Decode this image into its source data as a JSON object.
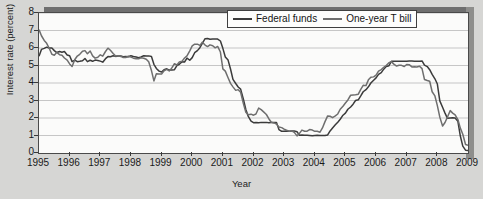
{
  "chart_data": {
    "type": "line",
    "title": "",
    "xlabel": "Year",
    "ylabel": "Interest rate (percent)",
    "xlim": [
      1995,
      2009
    ],
    "ylim": [
      0,
      8
    ],
    "xticks": [
      "1995",
      "1996",
      "1997",
      "1998",
      "1999",
      "2000",
      "2001",
      "2002",
      "2003",
      "2004",
      "2005",
      "2006",
      "2007",
      "2008",
      "2009"
    ],
    "yticks": [
      "0",
      "1",
      "2",
      "3",
      "4",
      "5",
      "6",
      "7",
      "8"
    ],
    "grid": "horizontal",
    "legend_position": "top-right",
    "series": [
      {
        "name": "Federal funds",
        "color": "#3b3b3b",
        "x": [
          1995.0,
          1995.08,
          1995.17,
          1995.25,
          1995.33,
          1995.42,
          1995.5,
          1995.58,
          1995.67,
          1995.75,
          1995.83,
          1995.92,
          1996.0,
          1996.08,
          1996.17,
          1996.25,
          1996.33,
          1996.42,
          1996.5,
          1996.58,
          1996.67,
          1996.75,
          1996.83,
          1996.92,
          1997.0,
          1997.08,
          1997.17,
          1997.25,
          1997.33,
          1997.42,
          1997.5,
          1997.58,
          1997.67,
          1997.75,
          1997.83,
          1997.92,
          1998.0,
          1998.08,
          1998.17,
          1998.25,
          1998.33,
          1998.42,
          1998.5,
          1998.58,
          1998.67,
          1998.75,
          1998.83,
          1998.92,
          1999.0,
          1999.08,
          1999.17,
          1999.25,
          1999.33,
          1999.42,
          1999.5,
          1999.58,
          1999.67,
          1999.75,
          1999.83,
          1999.92,
          2000.0,
          2000.08,
          2000.17,
          2000.25,
          2000.33,
          2000.42,
          2000.5,
          2000.58,
          2000.67,
          2000.75,
          2000.83,
          2000.92,
          2001.0,
          2001.08,
          2001.17,
          2001.25,
          2001.33,
          2001.42,
          2001.5,
          2001.58,
          2001.67,
          2001.75,
          2001.83,
          2001.92,
          2002.0,
          2002.08,
          2002.17,
          2002.25,
          2002.33,
          2002.42,
          2002.5,
          2002.58,
          2002.67,
          2002.75,
          2002.83,
          2002.92,
          2003.0,
          2003.08,
          2003.17,
          2003.25,
          2003.33,
          2003.42,
          2003.5,
          2003.58,
          2003.67,
          2003.75,
          2003.83,
          2003.92,
          2004.0,
          2004.08,
          2004.17,
          2004.25,
          2004.33,
          2004.42,
          2004.5,
          2004.58,
          2004.67,
          2004.75,
          2004.83,
          2004.92,
          2005.0,
          2005.08,
          2005.17,
          2005.25,
          2005.33,
          2005.42,
          2005.5,
          2005.58,
          2005.67,
          2005.75,
          2005.83,
          2005.92,
          2006.0,
          2006.08,
          2006.17,
          2006.25,
          2006.33,
          2006.42,
          2006.5,
          2006.58,
          2006.67,
          2006.75,
          2006.83,
          2006.92,
          2007.0,
          2007.08,
          2007.17,
          2007.25,
          2007.33,
          2007.42,
          2007.5,
          2007.58,
          2007.67,
          2007.75,
          2007.83,
          2007.92,
          2008.0,
          2008.08,
          2008.17,
          2008.25,
          2008.33,
          2008.42,
          2008.5,
          2008.58,
          2008.67,
          2008.75,
          2008.83,
          2008.92,
          2009.0
        ],
        "values": [
          5.53,
          5.92,
          5.98,
          6.05,
          6.0,
          6.0,
          5.85,
          5.74,
          5.8,
          5.76,
          5.8,
          5.6,
          5.56,
          5.22,
          5.31,
          5.22,
          5.24,
          5.27,
          5.4,
          5.22,
          5.3,
          5.24,
          5.31,
          5.29,
          5.25,
          5.19,
          5.39,
          5.51,
          5.5,
          5.56,
          5.52,
          5.54,
          5.54,
          5.5,
          5.52,
          5.5,
          5.56,
          5.51,
          5.49,
          5.45,
          5.49,
          5.56,
          5.54,
          5.55,
          5.51,
          5.07,
          4.83,
          4.68,
          4.63,
          4.76,
          4.81,
          4.74,
          4.74,
          4.76,
          4.99,
          5.07,
          5.22,
          5.2,
          5.42,
          5.3,
          5.45,
          5.73,
          5.85,
          6.02,
          6.27,
          6.53,
          6.54,
          6.5,
          6.52,
          6.51,
          6.51,
          6.4,
          5.98,
          5.49,
          5.31,
          4.8,
          4.21,
          3.97,
          3.77,
          3.65,
          3.07,
          2.49,
          2.09,
          1.82,
          1.73,
          1.74,
          1.73,
          1.75,
          1.75,
          1.75,
          1.73,
          1.74,
          1.75,
          1.75,
          1.34,
          1.24,
          1.24,
          1.26,
          1.25,
          1.26,
          1.26,
          1.22,
          1.01,
          1.03,
          1.01,
          1.01,
          1.0,
          0.98,
          1.0,
          1.01,
          1.0,
          1.0,
          1.0,
          1.03,
          1.26,
          1.43,
          1.61,
          1.76,
          1.93,
          2.16,
          2.28,
          2.5,
          2.63,
          2.79,
          3.0,
          3.04,
          3.26,
          3.5,
          3.62,
          3.78,
          4.0,
          4.16,
          4.29,
          4.49,
          4.59,
          4.79,
          4.94,
          4.99,
          5.24,
          5.25,
          5.25,
          5.25,
          5.25,
          5.24,
          5.25,
          5.26,
          5.26,
          5.25,
          5.25,
          5.25,
          5.26,
          5.02,
          4.94,
          4.76,
          4.49,
          4.24,
          3.94,
          2.98,
          2.61,
          2.28,
          1.98,
          2.0,
          2.01,
          2.0,
          1.81,
          0.97,
          0.39,
          0.16,
          0.15
        ]
      },
      {
        "name": "One-year T bill",
        "color": "#6e6e6e",
        "x": [
          1995.0,
          1995.08,
          1995.17,
          1995.25,
          1995.33,
          1995.42,
          1995.5,
          1995.58,
          1995.67,
          1995.75,
          1995.83,
          1995.92,
          1996.0,
          1996.08,
          1996.17,
          1996.25,
          1996.33,
          1996.42,
          1996.5,
          1996.58,
          1996.67,
          1996.75,
          1996.83,
          1996.92,
          1997.0,
          1997.08,
          1997.17,
          1997.25,
          1997.33,
          1997.42,
          1997.5,
          1997.58,
          1997.67,
          1997.75,
          1997.83,
          1997.92,
          1998.0,
          1998.08,
          1998.17,
          1998.25,
          1998.33,
          1998.42,
          1998.5,
          1998.58,
          1998.67,
          1998.75,
          1998.83,
          1998.92,
          1999.0,
          1999.08,
          1999.17,
          1999.25,
          1999.33,
          1999.42,
          1999.5,
          1999.58,
          1999.67,
          1999.75,
          1999.83,
          1999.92,
          2000.0,
          2000.08,
          2000.17,
          2000.25,
          2000.33,
          2000.42,
          2000.5,
          2000.58,
          2000.67,
          2000.75,
          2000.83,
          2000.92,
          2001.0,
          2001.08,
          2001.17,
          2001.25,
          2001.33,
          2001.42,
          2001.5,
          2001.58,
          2001.67,
          2001.75,
          2001.83,
          2001.92,
          2002.0,
          2002.08,
          2002.17,
          2002.25,
          2002.33,
          2002.42,
          2002.5,
          2002.58,
          2002.67,
          2002.75,
          2002.83,
          2002.92,
          2003.0,
          2003.08,
          2003.17,
          2003.25,
          2003.33,
          2003.42,
          2003.5,
          2003.58,
          2003.67,
          2003.75,
          2003.83,
          2003.92,
          2004.0,
          2004.08,
          2004.17,
          2004.25,
          2004.33,
          2004.42,
          2004.5,
          2004.58,
          2004.67,
          2004.75,
          2004.83,
          2004.92,
          2005.0,
          2005.08,
          2005.17,
          2005.25,
          2005.33,
          2005.42,
          2005.5,
          2005.58,
          2005.67,
          2005.75,
          2005.83,
          2005.92,
          2006.0,
          2006.08,
          2006.17,
          2006.25,
          2006.33,
          2006.42,
          2006.5,
          2006.58,
          2006.67,
          2006.75,
          2006.83,
          2006.92,
          2007.0,
          2007.08,
          2007.17,
          2007.25,
          2007.33,
          2007.42,
          2007.5,
          2007.58,
          2007.67,
          2007.75,
          2007.83,
          2007.92,
          2008.0,
          2008.08,
          2008.17,
          2008.25,
          2008.33,
          2008.42,
          2008.5,
          2008.58,
          2008.67,
          2008.75,
          2008.83,
          2008.92,
          2009.0
        ],
        "values": [
          7.05,
          6.7,
          6.43,
          6.27,
          6.0,
          5.64,
          5.59,
          5.75,
          5.62,
          5.59,
          5.43,
          5.31,
          5.09,
          4.94,
          5.34,
          5.54,
          5.64,
          5.81,
          5.85,
          5.67,
          5.83,
          5.55,
          5.42,
          5.47,
          5.61,
          5.53,
          5.8,
          5.99,
          5.87,
          5.69,
          5.54,
          5.56,
          5.52,
          5.46,
          5.46,
          5.53,
          5.48,
          5.42,
          5.39,
          5.38,
          5.44,
          5.41,
          5.36,
          5.21,
          4.71,
          4.12,
          4.53,
          4.52,
          4.51,
          4.7,
          4.78,
          4.69,
          4.85,
          5.1,
          5.03,
          5.2,
          5.25,
          5.43,
          5.55,
          5.84,
          6.12,
          6.22,
          6.22,
          6.15,
          6.33,
          6.17,
          6.08,
          6.18,
          6.13,
          6.01,
          6.09,
          5.77,
          4.81,
          4.68,
          4.3,
          3.98,
          3.78,
          3.58,
          3.62,
          3.47,
          2.82,
          2.33,
          2.18,
          2.22,
          2.16,
          2.23,
          2.57,
          2.48,
          2.35,
          2.2,
          1.96,
          1.76,
          1.72,
          1.65,
          1.49,
          1.45,
          1.36,
          1.3,
          1.24,
          1.27,
          1.18,
          0.98,
          1.12,
          1.31,
          1.24,
          1.25,
          1.34,
          1.31,
          1.24,
          1.24,
          1.19,
          1.43,
          1.78,
          2.12,
          2.1,
          2.02,
          2.12,
          2.23,
          2.5,
          2.67,
          2.86,
          3.03,
          3.3,
          3.32,
          3.33,
          3.36,
          3.64,
          3.87,
          3.85,
          4.18,
          4.33,
          4.35,
          4.45,
          4.68,
          4.77,
          4.9,
          5.0,
          5.16,
          5.22,
          5.08,
          4.97,
          5.01,
          5.01,
          4.94,
          5.06,
          5.05,
          4.92,
          4.93,
          4.91,
          4.96,
          4.82,
          4.2,
          4.14,
          4.1,
          3.5,
          3.26,
          2.71,
          2.05,
          1.54,
          1.74,
          2.06,
          2.42,
          2.28,
          2.18,
          1.91,
          1.42,
          1.07,
          0.49,
          0.44
        ]
      }
    ]
  },
  "legend": {
    "items": [
      {
        "label": "Federal funds"
      },
      {
        "label": "One-year T bill"
      }
    ]
  },
  "axes": {
    "x_title": "Year",
    "y_title": "Interest rate (percent)"
  }
}
